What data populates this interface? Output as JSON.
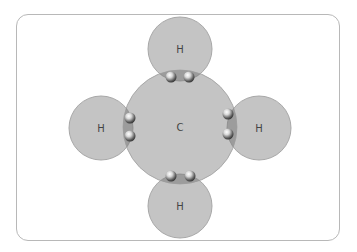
{
  "diagram": {
    "central_atom": {
      "label": "C",
      "cx": 180,
      "cy": 127,
      "r": 57
    },
    "outer_atoms": [
      {
        "id": "top",
        "label": "H",
        "cx": 180,
        "cy": 49,
        "r": 32
      },
      {
        "id": "left",
        "label": "H",
        "cx": 101,
        "cy": 128,
        "r": 32
      },
      {
        "id": "right",
        "label": "H",
        "cx": 259,
        "cy": 128,
        "r": 32
      },
      {
        "id": "bottom",
        "label": "H",
        "cx": 180,
        "cy": 206,
        "r": 32
      }
    ],
    "bonds": [
      {
        "id": "top",
        "electrons": [
          {
            "x": 171,
            "y": 77
          },
          {
            "x": 189,
            "y": 77
          }
        ]
      },
      {
        "id": "left",
        "electrons": [
          {
            "x": 130,
            "y": 118
          },
          {
            "x": 130,
            "y": 136
          }
        ]
      },
      {
        "id": "right",
        "electrons": [
          {
            "x": 228,
            "y": 114
          },
          {
            "x": 228,
            "y": 134
          }
        ]
      },
      {
        "id": "bottom",
        "electrons": [
          {
            "x": 171,
            "y": 176
          },
          {
            "x": 190,
            "y": 176
          }
        ]
      }
    ],
    "colors": {
      "atom_fill": "#c4c4c4",
      "atom_stroke": "#a8a8a8",
      "overlap_fill": "#9c9c9c",
      "electron": "#666666",
      "frame_border": "#b8b8b8",
      "label": "#444444"
    }
  }
}
